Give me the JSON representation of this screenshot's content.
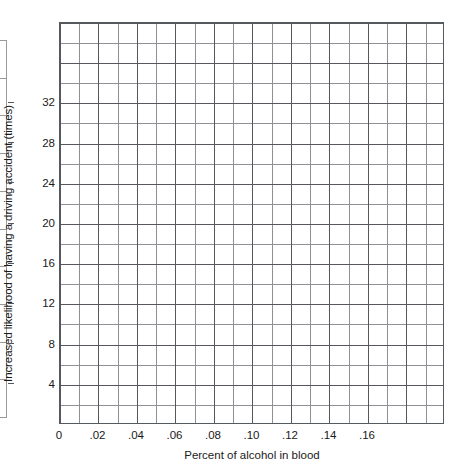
{
  "chart_data": {
    "type": "line",
    "title": "",
    "subtitle": "",
    "xlabel": "Percent of alcohol in blood",
    "ylabel": "Increased likelihood of having a driving accident (times)",
    "grid": true,
    "grid_minor": true,
    "legend": "none",
    "series": [],
    "x": [],
    "values": [],
    "note": "Blank grid / graph paper worksheet - no data plotted",
    "xlim": [
      0,
      0.2
    ],
    "ylim": [
      0,
      40
    ],
    "x_tick_values": [
      0,
      0.02,
      0.04,
      0.06,
      0.08,
      0.1,
      0.12,
      0.14,
      0.16
    ],
    "x_tick_labels": [
      "0",
      ".02",
      ".04",
      ".06",
      ".08",
      ".10",
      ".12",
      ".14",
      ".16"
    ],
    "y_tick_values": [
      4,
      8,
      12,
      16,
      20,
      24,
      28,
      32
    ],
    "y_tick_labels": [
      "4",
      "8",
      "12",
      "16",
      "20",
      "24",
      "28",
      "32"
    ],
    "x_major_step": 0.02,
    "x_minor_step": 0.01,
    "y_major_step": 4,
    "y_minor_step": 2,
    "colors": {
      "grid_major": "#55595d",
      "grid_minor": "#8d9195",
      "axis": "#55595d",
      "text": "#1a1a1a",
      "background": "#ffffff"
    }
  },
  "clipped_figure": {
    "name": "partial-table-left-edge",
    "rows": 10
  }
}
